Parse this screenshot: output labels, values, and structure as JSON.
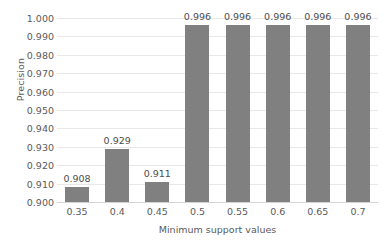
{
  "chart_data": {
    "type": "bar",
    "title": "",
    "xlabel": "Minimum support values",
    "ylabel": "Precision",
    "categories": [
      "0.35",
      "0.4",
      "0.45",
      "0.5",
      "0.55",
      "0.6",
      "0.65",
      "0.7"
    ],
    "values": [
      0.908,
      0.929,
      0.911,
      0.996,
      0.996,
      0.996,
      0.996,
      0.996
    ],
    "data_labels": [
      "0.908",
      "0.929",
      "0.911",
      "0.996",
      "0.996",
      "0.996",
      "0.996",
      "0.996"
    ],
    "ylim": [
      0.9,
      1.0
    ],
    "ytick_step": 0.01,
    "ytick_labels": [
      "1.000",
      "0.990",
      "0.980",
      "0.970",
      "0.960",
      "0.950",
      "0.940",
      "0.930",
      "0.920",
      "0.910",
      "0.900"
    ],
    "ytick_values": [
      1.0,
      0.99,
      0.98,
      0.97,
      0.96,
      0.95,
      0.94,
      0.93,
      0.92,
      0.91,
      0.9
    ],
    "grid": "horizontal",
    "legend": "none",
    "series": [
      {
        "name": "Precision",
        "values": [
          0.908,
          0.929,
          0.911,
          0.996,
          0.996,
          0.996,
          0.996,
          0.996
        ],
        "color": "#808080"
      }
    ],
    "colors": {
      "bar": "#808080",
      "gridline": "#e8e8e8",
      "baseline": "#d4d4d4",
      "tick_text": "#5a5a5a",
      "data_label_text": "#4d4d4d",
      "background": "#ffffff"
    }
  }
}
